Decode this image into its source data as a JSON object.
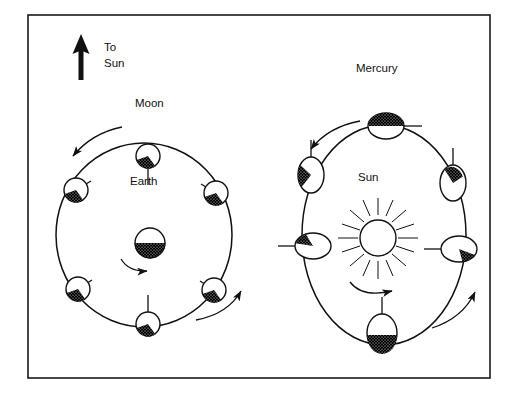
{
  "figure": {
    "title_visible": false,
    "frame": {
      "name": "outer-border",
      "x": 28,
      "y": 15,
      "width": 462,
      "height": 363,
      "stroke": "#1a1a1a",
      "stroke_width": 1.6,
      "fill": "#ffffff"
    },
    "colors": {
      "ink": "#111111",
      "shadow_fill": "#000000",
      "body_fill": "#ffffff",
      "page": "#ffffff"
    },
    "labels": [
      {
        "id": "to-sun",
        "text": "To\nSun",
        "lines": [
          "To",
          "Sun"
        ],
        "x": 104,
        "y": 48
      },
      {
        "id": "moon",
        "text": "Moon",
        "x": 135,
        "y": 103
      },
      {
        "id": "earth",
        "text": "Earth",
        "x": 130,
        "y": 181
      },
      {
        "id": "mercury",
        "text": "Mercury",
        "x": 356,
        "y": 68
      },
      {
        "id": "sun",
        "text": "Sun",
        "x": 358,
        "y": 177
      }
    ],
    "arrow_to_sun": {
      "name": "to-sun-arrow",
      "x": 81,
      "y_tail": 78,
      "y_head": 36,
      "direction": "up",
      "shaft_width": 5,
      "head_width": 15,
      "head_height": 18
    }
  },
  "panels": [
    {
      "id": "moon-earth-panel",
      "name": "moon-earth-diagram",
      "center_label": "Earth",
      "satellite_label": "Moon",
      "orbit": {
        "name": "moon-orbit-path",
        "cx": 144,
        "cy": 235,
        "rx": 88,
        "ry": 92,
        "shape": "ellipse",
        "stroke_width": 1.5
      },
      "central_body": {
        "name": "earth-body",
        "cx": 150,
        "cy": 243,
        "r": 15,
        "shape": "circle",
        "shaded_half": "bottom",
        "rotation_arrow": "counterclockwise-below"
      },
      "satellites": [
        {
          "id": "moon-top",
          "cx": 148,
          "cy": 156,
          "r": 12,
          "shaded_angle_deg": 200,
          "tick_angle_deg": 90,
          "tick_len": 17
        },
        {
          "id": "moon-upper-right",
          "cx": 216,
          "cy": 193,
          "r": 12,
          "shaded_angle_deg": 200,
          "tick_angle_deg": 150,
          "tick_len": 17
        },
        {
          "id": "moon-lower-right",
          "cx": 214,
          "cy": 290,
          "r": 12,
          "shaded_angle_deg": 200,
          "tick_angle_deg": 215,
          "tick_len": 17
        },
        {
          "id": "moon-bottom",
          "cx": 148,
          "cy": 324,
          "r": 12,
          "shaded_angle_deg": 200,
          "tick_angle_deg": 270,
          "tick_len": 17
        },
        {
          "id": "moon-lower-left",
          "cx": 78,
          "cy": 289,
          "r": 12,
          "shaded_angle_deg": 200,
          "tick_angle_deg": 330,
          "tick_len": 17
        },
        {
          "id": "moon-upper-left",
          "cx": 76,
          "cy": 190,
          "r": 12,
          "shaded_angle_deg": 200,
          "tick_angle_deg": 35,
          "tick_len": 17
        }
      ],
      "orbit_arrows": [
        {
          "id": "moon-orbit-arrow-top-left",
          "d": "M 120 128 Q 90 134 72 157",
          "head_at": "end",
          "head_angle_deg": 128
        },
        {
          "id": "moon-orbit-arrow-bottom-right",
          "d": "M 196 319 Q 226 313 240 292",
          "head_at": "end",
          "head_angle_deg": -56
        }
      ]
    },
    {
      "id": "mercury-sun-panel",
      "name": "mercury-sun-diagram",
      "center_label": "Sun",
      "satellite_label": "Mercury",
      "orbit": {
        "name": "mercury-orbit-path",
        "cx": 384,
        "cy": 235,
        "rx": 82,
        "ry": 110,
        "shape": "ellipse",
        "stroke_width": 1.5
      },
      "central_body": {
        "name": "sun-body",
        "cx": 378,
        "cy": 238,
        "r": 18,
        "shape": "circle-with-rays",
        "ray_count": 16,
        "ray_inner": 23,
        "ray_outer": 40,
        "rotation_arrow": "counterclockwise-below"
      },
      "satellites": [
        {
          "id": "mercury-top",
          "cx": 386,
          "cy": 126,
          "rx": 18,
          "ry": 13,
          "shaded_angle_deg": 90,
          "tick_angle_deg": 0,
          "tick_len": 18
        },
        {
          "id": "mercury-upper-right",
          "cx": 453,
          "cy": 183,
          "rx": 13,
          "ry": 18,
          "shaded_angle_deg": 45,
          "tick_angle_deg": 270,
          "tick_len": 18
        },
        {
          "id": "mercury-lower-right",
          "cx": 459,
          "cy": 249,
          "rx": 18,
          "ry": 13,
          "shaded_angle_deg": 340,
          "tick_angle_deg": 180,
          "tick_len": 18
        },
        {
          "id": "mercury-bottom",
          "cx": 382,
          "cy": 333,
          "rx": 15,
          "ry": 19,
          "shaded_angle_deg": 260,
          "tick_angle_deg": 90,
          "tick_len": 18
        },
        {
          "id": "mercury-lower-left",
          "cx": 313,
          "cy": 246,
          "rx": 18,
          "ry": 13,
          "shaded_angle_deg": 160,
          "tick_angle_deg": 180,
          "tick_len": 18
        },
        {
          "id": "mercury-upper-left",
          "cx": 311,
          "cy": 175,
          "rx": 13,
          "ry": 18,
          "shaded_angle_deg": 140,
          "tick_angle_deg": 90,
          "tick_len": 18
        }
      ],
      "orbit_arrows": [
        {
          "id": "mercury-orbit-arrow-top-left",
          "d": "M 358 122 Q 326 128 310 150",
          "head_at": "end",
          "head_angle_deg": 128
        },
        {
          "id": "mercury-orbit-arrow-bottom-right",
          "d": "M 432 327 Q 462 317 474 293",
          "head_at": "end",
          "head_angle_deg": -62
        }
      ]
    }
  ]
}
